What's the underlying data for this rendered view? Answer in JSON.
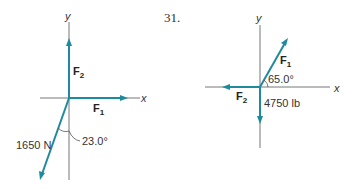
{
  "problem_number": "31.",
  "colors": {
    "vector": "#1e8a9e",
    "axis": "#777777",
    "text": "#333333"
  },
  "diagram_left": {
    "axis_x_label": "x",
    "axis_y_label": "y",
    "vectors": [
      {
        "name": "F",
        "sub": "2",
        "direction_deg": 90,
        "magnitude_label": ""
      },
      {
        "name": "F",
        "sub": "1",
        "direction_deg": 0,
        "magnitude_label": ""
      },
      {
        "name": "",
        "sub": "",
        "direction_deg": 247,
        "magnitude_label": "1650 N"
      }
    ],
    "angle_label": "23.0°"
  },
  "diagram_right": {
    "axis_x_label": "x",
    "axis_y_label": "y",
    "vectors": [
      {
        "name": "F",
        "sub": "1",
        "direction_deg": 65,
        "magnitude_label": ""
      },
      {
        "name": "F",
        "sub": "2",
        "direction_deg": 180,
        "magnitude_label": ""
      },
      {
        "name": "",
        "sub": "",
        "direction_deg": 270,
        "magnitude_label": "4750 lb"
      }
    ],
    "angle_label": "65.0°"
  }
}
